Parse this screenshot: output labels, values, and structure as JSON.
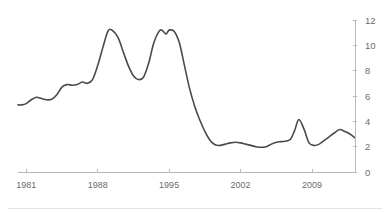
{
  "chart_data": {
    "type": "line",
    "title": "",
    "subtitle": "",
    "xlabel": "",
    "ylabel": "",
    "grid": false,
    "legend": "none",
    "y_axis_position": "right",
    "x_axis_position": "bottom",
    "xlim": [
      1980.2,
      2013.2
    ],
    "ylim": [
      0,
      12
    ],
    "xticks": [
      1981,
      1988,
      1995,
      2002,
      2009
    ],
    "xtick_labels": [
      "1981",
      "1988",
      "1995",
      "2002",
      "2009"
    ],
    "yticks": [
      0,
      2,
      4,
      6,
      8,
      10,
      12
    ],
    "ytick_labels": [
      "0",
      "2",
      "4",
      "6",
      "8",
      "10",
      "12"
    ],
    "line_color": "#4a4a4a",
    "series": [
      {
        "name": "series-1",
        "x": [
          1980.2,
          1980.6,
          1981.0,
          1981.5,
          1982.0,
          1982.5,
          1983.0,
          1983.5,
          1984.0,
          1984.5,
          1985.0,
          1985.5,
          1986.0,
          1986.5,
          1987.0,
          1987.5,
          1988.0,
          1988.5,
          1989.0,
          1989.4,
          1990.0,
          1990.5,
          1991.0,
          1991.5,
          1992.0,
          1992.5,
          1993.0,
          1993.5,
          1994.0,
          1994.3,
          1994.7,
          1995.0,
          1995.5,
          1996.0,
          1996.5,
          1997.0,
          1997.5,
          1998.0,
          1998.5,
          1999.0,
          1999.5,
          2000.0,
          2000.5,
          2001.0,
          2001.5,
          2002.0,
          2002.5,
          2003.0,
          2003.5,
          2004.0,
          2004.5,
          2005.0,
          2005.5,
          2006.0,
          2006.5,
          2006.9,
          2007.3,
          2007.7,
          2008.2,
          2008.7,
          2009.2,
          2009.7,
          2010.2,
          2010.7,
          2011.2,
          2011.7,
          2012.2,
          2012.7,
          2013.2
        ],
        "values": [
          5.3,
          5.3,
          5.4,
          5.7,
          5.9,
          5.8,
          5.7,
          5.75,
          6.1,
          6.7,
          6.9,
          6.85,
          6.9,
          7.1,
          7.0,
          7.3,
          8.4,
          9.8,
          11.1,
          11.2,
          10.6,
          9.5,
          8.4,
          7.6,
          7.3,
          7.5,
          8.6,
          10.2,
          11.1,
          11.2,
          10.9,
          11.2,
          11.1,
          10.2,
          8.4,
          6.6,
          5.2,
          4.1,
          3.2,
          2.5,
          2.15,
          2.1,
          2.2,
          2.3,
          2.35,
          2.3,
          2.2,
          2.1,
          2.0,
          1.95,
          2.0,
          2.2,
          2.35,
          2.4,
          2.45,
          2.6,
          3.3,
          4.15,
          3.4,
          2.3,
          2.1,
          2.2,
          2.5,
          2.8,
          3.1,
          3.35,
          3.2,
          3.0,
          2.7
        ]
      }
    ]
  },
  "axes": {
    "y_tick_labels": [
      "12",
      "10",
      "8",
      "6",
      "4",
      "2",
      "0"
    ],
    "x_tick_labels": [
      "1981",
      "1988",
      "1995",
      "2002",
      "2009"
    ]
  }
}
